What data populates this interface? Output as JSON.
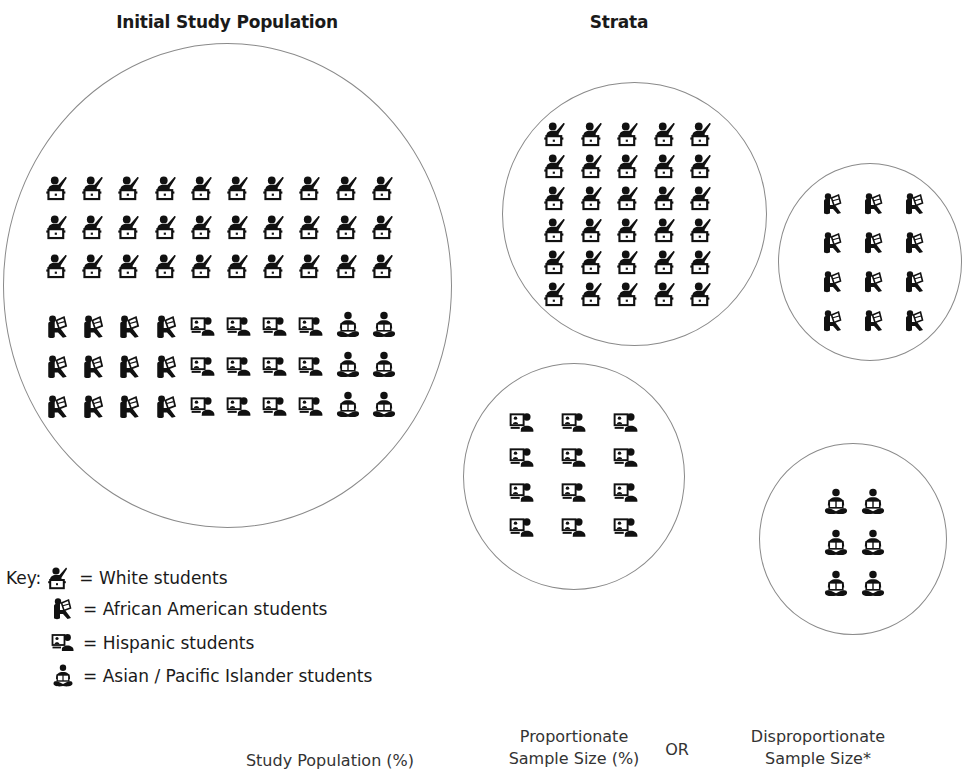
{
  "titles": {
    "initial": "Initial Study Population",
    "strata": "Strata"
  },
  "key": {
    "prefix": "Key:",
    "items": [
      {
        "icon": "white-student-icon",
        "label": "= White students"
      },
      {
        "icon": "african-american-student-icon",
        "label": "= African American students"
      },
      {
        "icon": "hispanic-student-icon",
        "label": "= Hispanic students"
      },
      {
        "icon": "asian-pacific-islander-student-icon",
        "label": "= Asian / Pacific Islander students"
      }
    ]
  },
  "bottom_labels": {
    "study_population": "Study Population (%)",
    "proportionate_line1": "Proportionate",
    "proportionate_line2": "Sample Size (%)",
    "or": "OR",
    "disproportionate_line1": "Disproportionate",
    "disproportionate_line2": "Sample Size*"
  },
  "colors": {
    "circle_stroke": "#8a8a8a",
    "icon_fill": "#111111",
    "text": "#1a1a1a"
  },
  "chart_data": {
    "type": "table",
    "groups": [
      "White students",
      "African American students",
      "Hispanic students",
      "Asian / Pacific Islander students"
    ],
    "initial_population_icon_counts": [
      30,
      12,
      12,
      6
    ],
    "strata_icon_counts": [
      30,
      12,
      12,
      6
    ],
    "initial_layout": {
      "white_rows": 3,
      "white_cols": 10,
      "lower_rows": 3,
      "lower_cols": {
        "african_american": 4,
        "hispanic": 4,
        "asian_pacific_islander": 2
      }
    },
    "strata_layout": {
      "white": {
        "rows": 6,
        "cols": 5
      },
      "african_american": {
        "rows": 4,
        "cols": 3
      },
      "hispanic": {
        "rows": 4,
        "cols": 3
      },
      "asian_pacific_islander": {
        "rows": 3,
        "cols": 2
      }
    }
  }
}
